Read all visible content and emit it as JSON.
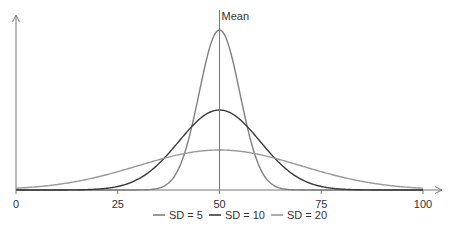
{
  "chart_data": {
    "type": "line",
    "title": "",
    "xlabel": "",
    "ylabel": "",
    "xlim": [
      0,
      100
    ],
    "xticks": [
      0,
      25,
      50,
      75,
      100
    ],
    "tick_labels": [
      "0",
      "25",
      "50",
      "75",
      "100"
    ],
    "grid": false,
    "mean": 50,
    "mean_label": "Mean",
    "legend_position": "bottom-center",
    "series": [
      {
        "name": "SD = 5",
        "mean": 50,
        "sd": 5,
        "color": "#808080"
      },
      {
        "name": "SD = 10",
        "mean": 50,
        "sd": 10,
        "color": "#3a3a3a"
      },
      {
        "name": "SD = 20",
        "mean": 50,
        "sd": 20,
        "color": "#999999"
      }
    ]
  }
}
